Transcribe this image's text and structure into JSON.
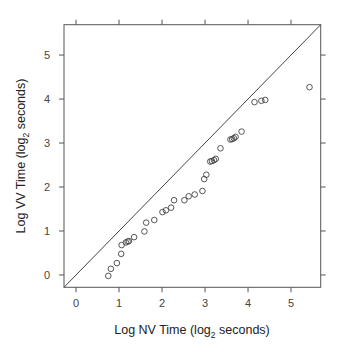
{
  "chart_data": {
    "type": "scatter",
    "title": "",
    "xlabel": "Log NV Time (log2 seconds)",
    "ylabel": "Log VV Time (log2 seconds)",
    "xlabel_parts": {
      "pre": "Log NV Time (log",
      "sub": "2",
      "post": " seconds)"
    },
    "ylabel_parts": {
      "pre": "Log VV Time (log",
      "sub": "2",
      "post": " seconds)"
    },
    "xlim": [
      -0.28,
      5.69
    ],
    "ylim": [
      -0.28,
      5.69
    ],
    "xticks": [
      0,
      1,
      2,
      3,
      4,
      5
    ],
    "yticks": [
      0,
      1,
      2,
      3,
      4,
      5
    ],
    "grid": false,
    "legend": null,
    "reference_line": {
      "type": "identity",
      "label": "y = x"
    },
    "marker": "open-circle",
    "colors": {
      "axis": "#555555",
      "points": "#444444",
      "line": "#444444"
    },
    "series": [
      {
        "name": "timings",
        "points": [
          [
            0.75,
            -0.02
          ],
          [
            0.81,
            0.14
          ],
          [
            0.95,
            0.27
          ],
          [
            1.05,
            0.48
          ],
          [
            1.06,
            0.68
          ],
          [
            1.16,
            0.74
          ],
          [
            1.2,
            0.76
          ],
          [
            1.23,
            0.77
          ],
          [
            1.35,
            0.86
          ],
          [
            1.59,
            0.99
          ],
          [
            1.63,
            1.19
          ],
          [
            1.82,
            1.25
          ],
          [
            2.01,
            1.43
          ],
          [
            2.09,
            1.47
          ],
          [
            2.21,
            1.53
          ],
          [
            2.28,
            1.7
          ],
          [
            2.52,
            1.7
          ],
          [
            2.62,
            1.79
          ],
          [
            2.76,
            1.83
          ],
          [
            2.94,
            1.91
          ],
          [
            2.98,
            2.18
          ],
          [
            3.03,
            2.28
          ],
          [
            3.12,
            2.58
          ],
          [
            3.16,
            2.59
          ],
          [
            3.21,
            2.61
          ],
          [
            3.25,
            2.64
          ],
          [
            3.36,
            2.88
          ],
          [
            3.59,
            3.08
          ],
          [
            3.63,
            3.09
          ],
          [
            3.67,
            3.11
          ],
          [
            3.71,
            3.14
          ],
          [
            3.85,
            3.26
          ],
          [
            4.15,
            3.93
          ],
          [
            4.31,
            3.96
          ],
          [
            4.4,
            3.98
          ],
          [
            5.43,
            4.27
          ]
        ]
      }
    ]
  }
}
